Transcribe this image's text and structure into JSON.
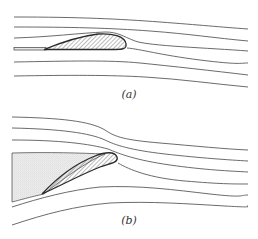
{
  "figure": {
    "panels": [
      {
        "label": "(a)",
        "description": "Streamlines flowing past a thin cambered airfoil at low angle of attack with a flat leading plate; flow stays attached"
      },
      {
        "label": "(b)",
        "description": "Streamlines flowing past an inclined airfoil at high angle of attack; a stippled separated wake/dead-water region forms upstream-below the airfoil and streamlines bunch over the nose"
      }
    ],
    "colors": {
      "streamline": "#5a5a5a",
      "airfoil_outline": "#2a2a2a",
      "hatch": "#555555",
      "separated_region": "#e6e6e6",
      "background": "#ffffff"
    }
  }
}
